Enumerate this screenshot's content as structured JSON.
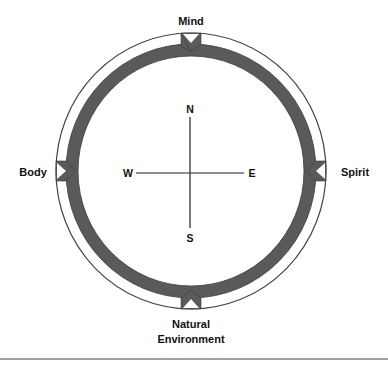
{
  "diagram": {
    "labels": {
      "top": "Mind",
      "left": "Body",
      "right": "Spirit",
      "bottom_line1": "Natural",
      "bottom_line2": "Environment"
    },
    "compass": {
      "north": "N",
      "south": "S",
      "east": "E",
      "west": "W"
    },
    "colors": {
      "ring": "#5a5a5a",
      "outline": "#333333",
      "text": "#111111",
      "background": "#ffffff"
    }
  }
}
